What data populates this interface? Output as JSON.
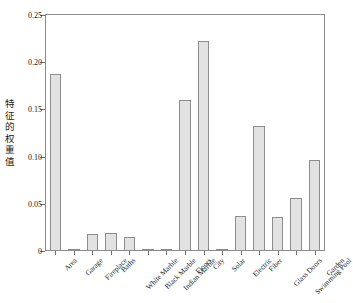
{
  "chart_data": {
    "type": "bar",
    "title": "",
    "subtitle": "",
    "xlabel": "",
    "ylabel": "特征的权重值",
    "categories": [
      "Area",
      "Garage",
      "Fireplace",
      "Baths",
      "White Marble",
      "Black Marble",
      "Indian Marble",
      "Floors",
      "City",
      "Solar",
      "Electric",
      "Fiber",
      "Glass Doors",
      "Swimming Pool",
      "Garden"
    ],
    "values": [
      0.188,
      0.002,
      0.018,
      0.019,
      0.015,
      0.001,
      0.002,
      0.16,
      0.222,
      0.002,
      0.037,
      0.132,
      0.036,
      0.056,
      0.096
    ],
    "ylim": [
      0,
      0.25
    ],
    "yticks": [
      0,
      0.05,
      0.1,
      0.15,
      0.2,
      0.25
    ],
    "ytick_labels": [
      "0",
      "0.05",
      "0.10",
      "0.15",
      "0.20",
      "0.25"
    ],
    "grid": false,
    "legend": null,
    "legend_position": "none",
    "bar_fill_color": "#e2e2e2",
    "bar_edge_color": "#8d8d8d",
    "axis_color": "#8a8a8a",
    "text_color": "#1a1a1a",
    "background_color": "#ffffff",
    "xtick_rotation_deg": -45
  }
}
